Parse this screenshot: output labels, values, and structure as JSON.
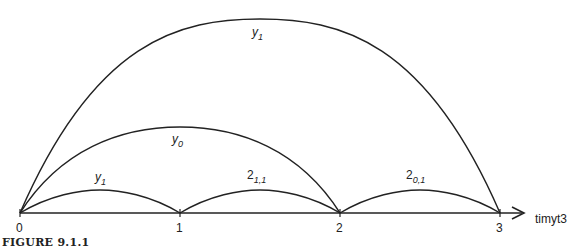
{
  "figure": {
    "caption": "FIGURE 9.1.1",
    "axis": {
      "label": "timyt3",
      "ticks": [
        "0",
        "1",
        "2",
        "3"
      ]
    },
    "arcs": [
      {
        "from": "0",
        "to": "3",
        "label_main": "y",
        "label_sub": "1"
      },
      {
        "from": "0",
        "to": "2",
        "label_main": "y",
        "label_sub": "0"
      },
      {
        "from": "0",
        "to": "1",
        "label_main": "y",
        "label_sub": "1"
      },
      {
        "from": "1",
        "to": "2",
        "label_main": "2",
        "label_sub": "1,1"
      },
      {
        "from": "2",
        "to": "3",
        "label_main": "2",
        "label_sub": "0,1"
      }
    ]
  }
}
